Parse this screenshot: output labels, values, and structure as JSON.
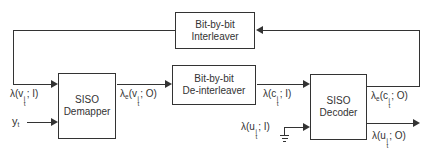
{
  "diagram": {
    "blocks": {
      "interleaver": {
        "line1": "Bit-by-bit",
        "line2": "Interleaver"
      },
      "deinterleaver": {
        "line1": "Bit-by-bit",
        "line2": "De-interleaver"
      },
      "demapper": {
        "line1": "SISO",
        "line2": "Demapper"
      },
      "decoder": {
        "line1": "SISO",
        "line2": "Decoder"
      }
    },
    "signals": {
      "demapper_input": {
        "lam": "λ",
        "lamsub": "",
        "open": "(",
        "var": "v",
        "sup": "i",
        "sub": "t",
        "close": "; I)"
      },
      "demapper_output": {
        "lam": "λ",
        "lamsub": "e",
        "open": "(",
        "var": "v",
        "sup": "i",
        "sub": "t",
        "close": "; O)"
      },
      "decoder_code_input": {
        "lam": "λ",
        "lamsub": "",
        "open": "(",
        "var": "c",
        "sup": "i",
        "sub": "t",
        "close": "; I)"
      },
      "decoder_code_output": {
        "lam": "λ",
        "lamsub": "e",
        "open": "(",
        "var": "c",
        "sup": "i",
        "sub": "t",
        "close": "; O)"
      },
      "decoder_info_input": {
        "lam": "λ",
        "lamsub": "",
        "open": "(",
        "var": "u",
        "sup": "i",
        "sub": "t",
        "close": "; I)"
      },
      "decoder_info_output": {
        "lam": "λ",
        "lamsub": "",
        "open": "(",
        "var": "u",
        "sup": "i",
        "sub": "t",
        "close": "; O)"
      },
      "received_symbols": {
        "var": "y",
        "sub": "t"
      }
    },
    "colors": {
      "line": "#333333",
      "background": "#ffffff",
      "box_fill": "#ffffff"
    }
  }
}
